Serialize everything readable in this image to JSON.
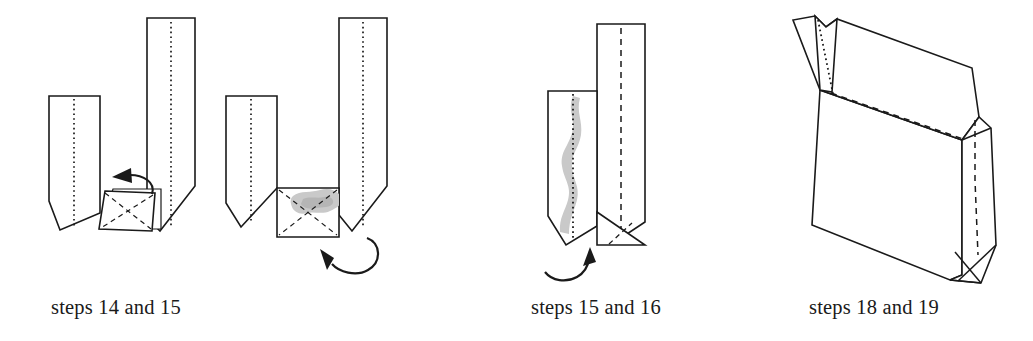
{
  "page": {
    "background_color": "#ffffff",
    "ink_color": "#1a1a1a",
    "shade_color": "#c9c9c9",
    "width": 1033,
    "height": 341
  },
  "figures": [
    {
      "id": "figure-steps-14-15",
      "caption": "steps 14 and 15",
      "description": "U-shaped folded paper with short left panel and tall right panel; small square flap at the bottom center with X crease lines, and a curved arrow pointing left",
      "elements": [
        "left-panel",
        "right-tall-panel",
        "bottom-square-flap",
        "x-crease-lines",
        "left-pointing-curved-arrow"
      ],
      "dotted_center_creases": 2
    },
    {
      "id": "figure-steps-14-15-result",
      "caption": "",
      "description": "Same U-shape with the bottom square now flattened, shaded gray, showing X crease lines; a curved arrow below loops up from the right",
      "elements": [
        "left-panel",
        "right-tall-panel",
        "bottom-square-shaded",
        "x-crease-lines",
        "upward-curved-arrow"
      ],
      "dotted_center_creases": 2,
      "shaded": true
    },
    {
      "id": "figure-steps-15-16",
      "caption": "steps 15 and 16",
      "description": "Folded flat bag seen at an angle, short front-left panel with wavy gray shading along the dotted crease, tall right panel with dashed crease, triangular fold at bottom right, curved arrow pointing up below",
      "elements": [
        "front-left-panel",
        "wavy-gray-shading",
        "tall-right-panel",
        "dashed-center-crease",
        "bottom-triangle-fold",
        "upward-curved-arrow"
      ],
      "shaded": true
    },
    {
      "id": "figure-steps-18-19",
      "caption": "steps 18 and 19",
      "description": "Completed three dimensional paper bag with open top, V-notch at the top left, side gusset on the right with dashed center crease and crossed base folds",
      "elements": [
        "bag-front-face",
        "bag-top-opening",
        "v-notch-top-left",
        "right-gusset-panel",
        "dashed-gusset-crease",
        "crossed-base-folds"
      ]
    }
  ],
  "captions": {
    "figure1": "steps 14 and 15",
    "figure2": "steps 15 and 16",
    "figure3": "steps 18 and 19"
  }
}
